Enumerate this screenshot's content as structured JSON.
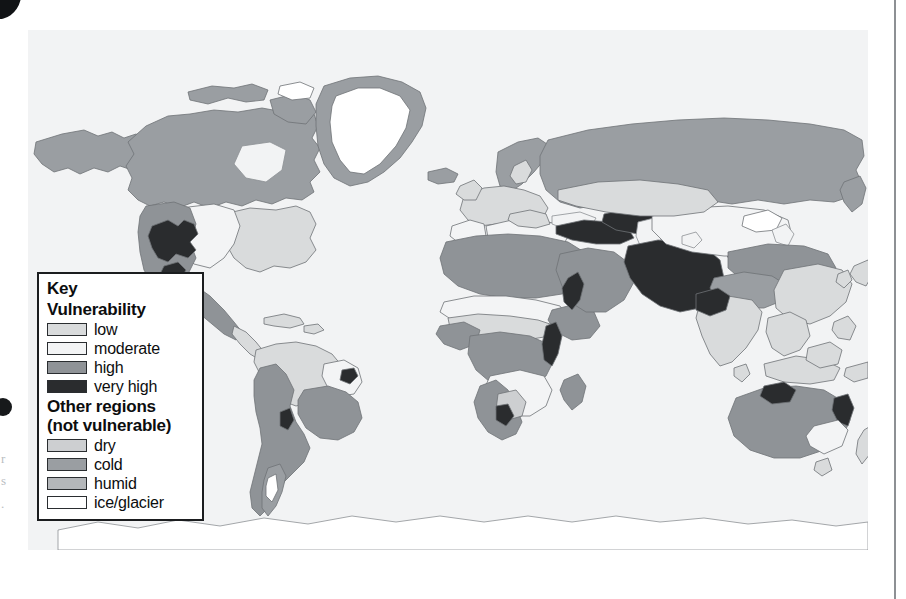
{
  "figure": {
    "type": "choropleth-world-map",
    "background_color": "#f2f3f4",
    "projection": "equirectangular"
  },
  "legend": {
    "title": "Key",
    "vulnerability_heading": "Vulnerability",
    "other_heading_line1": "Other regions",
    "other_heading_line2": "(not vulnerable)",
    "vulnerability_classes": [
      {
        "label": "low",
        "color": "#d9dbdc"
      },
      {
        "label": "moderate",
        "color": "#f3f4f5"
      },
      {
        "label": "high",
        "color": "#8f9397"
      },
      {
        "label": "very high",
        "color": "#2a2c2e"
      }
    ],
    "other_classes": [
      {
        "label": "dry",
        "color": "#cdcfd1"
      },
      {
        "label": "cold",
        "color": "#9a9ea2"
      },
      {
        "label": "humid",
        "color": "#b4b7ba"
      },
      {
        "label": "ice/glacier",
        "color": "#ffffff"
      }
    ]
  },
  "map_regions": {
    "very_high": [
      "western United States interior",
      "northern Mexico highlands",
      "Caucasus and Anatolian highlands",
      "Iran and Afghanistan",
      "Central Asia / Tian Shan",
      "northwest India / Pakistan",
      "Red Sea coastal strip",
      "northern and eastern Australia margins",
      "eastern Brazil interior",
      "southern Africa interior"
    ],
    "high": [
      "Sahel belt of Africa",
      "Arabian Peninsula",
      "Mongolia and north China",
      "southern Africa",
      "Australian interior",
      "Andean western South America",
      "southwestern North America"
    ],
    "moderate": [
      "Mediterranean basin",
      "Kazakh steppe",
      "interior Asia basins",
      "Kalahari / southern Africa basin",
      "Great Plains margins",
      "northeast Brazil"
    ],
    "low": [
      "eastern United States",
      "Europe",
      "India",
      "Southeast Asia",
      "Amazon basin",
      "equatorial Africa"
    ],
    "cold": [
      "Canada and Alaska",
      "Siberia and northern Russia",
      "Scandinavia",
      "Tibetan Plateau",
      "Patagonia",
      "Greenland coastal fringe"
    ],
    "ice_glacier": [
      "Greenland ice sheet",
      "Antarctica",
      "Arctic archipelago ice caps"
    ]
  }
}
